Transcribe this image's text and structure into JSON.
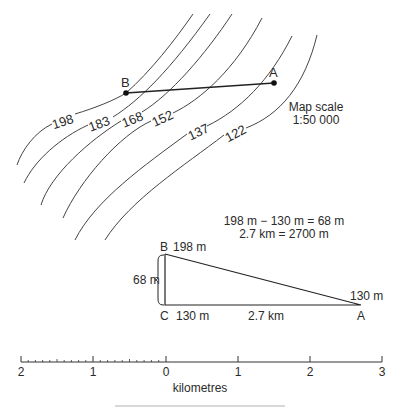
{
  "map": {
    "contours": [
      {
        "value": "198",
        "label": "198"
      },
      {
        "value": "183",
        "label": "183"
      },
      {
        "value": "168",
        "label": "168"
      },
      {
        "value": "152",
        "label": "152"
      },
      {
        "value": "137",
        "label": "137"
      },
      {
        "value": "122",
        "label": "122"
      }
    ],
    "point_a": "A",
    "point_b": "B",
    "scale_title": "Map scale",
    "scale_ratio": "1:50 000"
  },
  "calculation": {
    "line1": "198 m − 130 m = 68 m",
    "line2": "2.7 km = 2700 m"
  },
  "triangle": {
    "b_label": "B",
    "b_height": "198 m",
    "c_label": "C",
    "c_height": "130 m",
    "a_label": "A",
    "a_height": "130 m",
    "vertical": "68 m",
    "horizontal": "2.7 km"
  },
  "scale_bar": {
    "ticks": [
      "2",
      "1",
      "0",
      "1",
      "2",
      "3"
    ],
    "unit": "kilometres"
  }
}
